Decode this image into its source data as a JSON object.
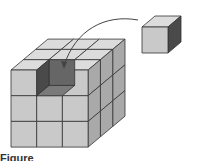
{
  "figure": {
    "type": "3x3x3 cube with one cube removed",
    "grid_size": 3,
    "removed_cell": {
      "layer": "top",
      "row": "front",
      "column": "middle"
    },
    "caption": "Figure"
  },
  "colors": {
    "front": "#c9c9c9",
    "top": "#dcdcdc",
    "side": "#a9a9a9",
    "hole_dark": "#4a4a4a",
    "hole_mid": "#666666",
    "hole_floor": "#7a7a7a",
    "edge": "#333333",
    "arrow": "#444444"
  }
}
